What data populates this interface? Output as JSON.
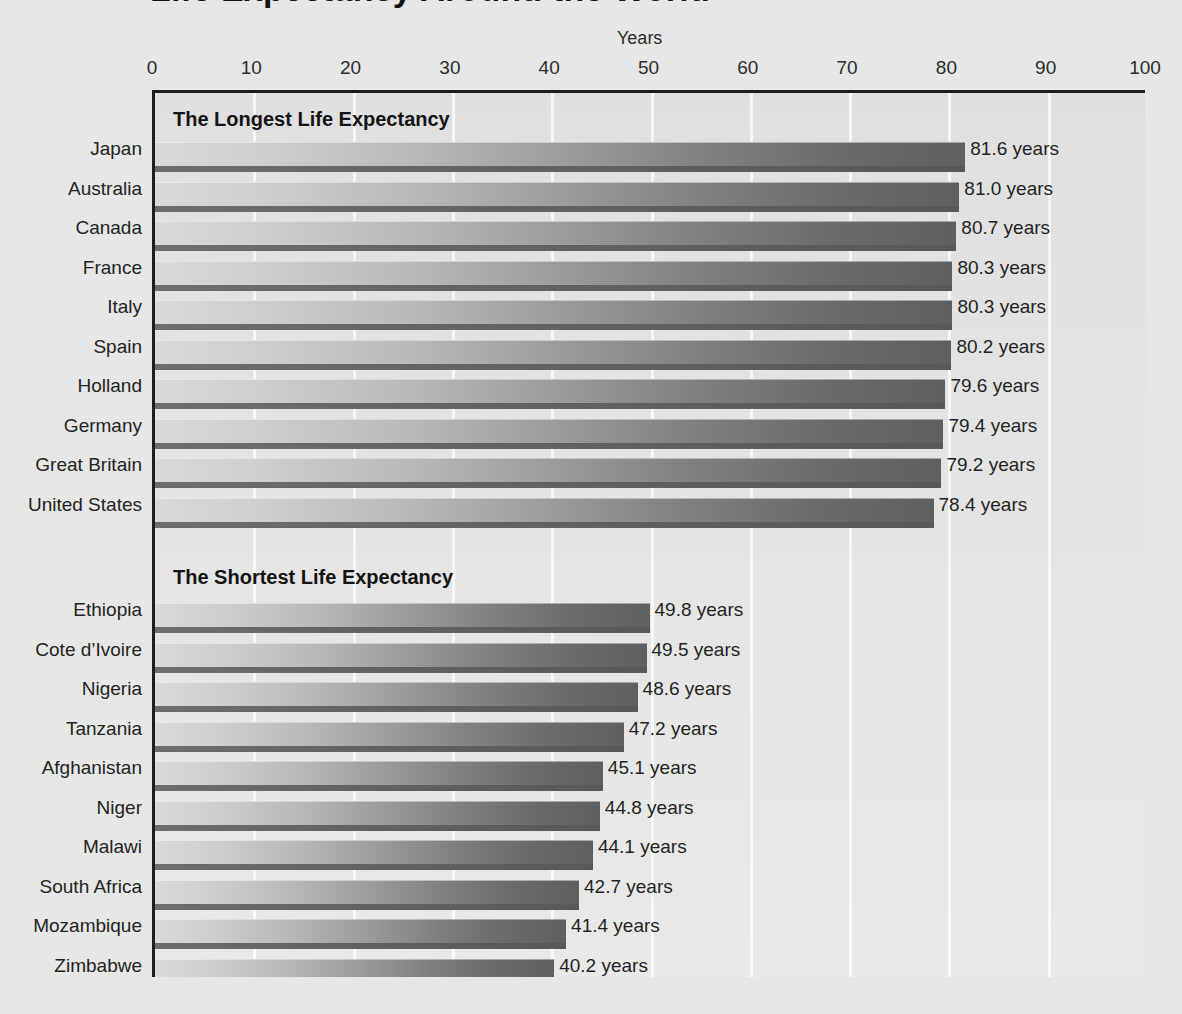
{
  "page": {
    "title": "Life Expectancy Around the World",
    "background_color": "#e9e9e9"
  },
  "axis": {
    "title": "Years",
    "tick_labels": [
      "0",
      "10",
      "20",
      "30",
      "40",
      "50",
      "60",
      "70",
      "80",
      "90",
      "100"
    ]
  },
  "sections": [
    {
      "heading": "The Longest Life Expectancy"
    },
    {
      "heading": "The Shortest Life Expectancy"
    }
  ],
  "chart_data": {
    "type": "bar",
    "orientation": "horizontal",
    "title": "Life Expectancy Around the World",
    "xlabel": "Years",
    "ylabel": "",
    "xlim": [
      0,
      100
    ],
    "xticks": [
      0,
      10,
      20,
      30,
      40,
      50,
      60,
      70,
      80,
      90,
      100
    ],
    "grid": "vertical",
    "legend": "none",
    "value_suffix": "years",
    "groups": [
      {
        "name": "The Longest Life Expectancy",
        "categories": [
          "Japan",
          "Australia",
          "Canada",
          "France",
          "Italy",
          "Spain",
          "Holland",
          "Germany",
          "Great Britain",
          "United States"
        ],
        "values": [
          81.6,
          81.0,
          80.7,
          80.3,
          80.3,
          80.2,
          79.6,
          79.4,
          79.2,
          78.4
        ],
        "value_labels": [
          "81.6 years",
          "81.0 years",
          "80.7 years",
          "80.3 years",
          "80.3 years",
          "80.2 years",
          "79.6 years",
          "79.4 years",
          "79.2 years",
          "78.4 years"
        ]
      },
      {
        "name": "The Shortest Life Expectancy",
        "categories": [
          "Ethiopia",
          "Cote d’Ivoire",
          "Nigeria",
          "Tanzania",
          "Afghanistan",
          "Niger",
          "Malawi",
          "South Africa",
          "Mozambique",
          "Zimbabwe"
        ],
        "values": [
          49.8,
          49.5,
          48.6,
          47.2,
          45.1,
          44.8,
          44.1,
          42.7,
          41.4,
          40.2
        ],
        "value_labels": [
          "49.8 years",
          "49.5 years",
          "48.6 years",
          "47.2 years",
          "45.1 years",
          "44.8 years",
          "44.1 years",
          "42.7 years",
          "41.4 years",
          "40.2 years"
        ]
      }
    ]
  },
  "colors": {
    "bar_light": "#dcdcdc",
    "bar_dark": "#5f5f5f",
    "plot_background": "#e6e6e6",
    "gridline": "#ffffff",
    "axis_line": "#1d1d1d",
    "text": "#1f1f1f"
  }
}
